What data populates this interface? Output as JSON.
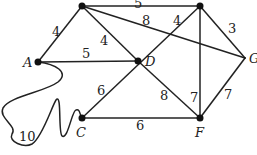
{
  "graph": {
    "nodes": {
      "A": {
        "label": "A"
      },
      "B": {
        "label": ""
      },
      "E": {
        "label": ""
      },
      "D": {
        "label": "D"
      },
      "G": {
        "label": "G"
      },
      "C": {
        "label": "C"
      },
      "F": {
        "label": "F"
      }
    },
    "edges": [
      {
        "from": "A",
        "to": "B",
        "weight": "4"
      },
      {
        "from": "B",
        "to": "E",
        "weight": "5"
      },
      {
        "from": "B",
        "to": "G",
        "weight": "8"
      },
      {
        "from": "B",
        "to": "D",
        "weight": "4"
      },
      {
        "from": "A",
        "to": "D",
        "weight": "5"
      },
      {
        "from": "E",
        "to": "C",
        "weight": "4"
      },
      {
        "from": "E",
        "to": "G",
        "weight": "3"
      },
      {
        "from": "E",
        "to": "F",
        "weight": "7"
      },
      {
        "from": "D",
        "to": "C",
        "weight": "6"
      },
      {
        "from": "D",
        "to": "F",
        "weight": "8"
      },
      {
        "from": "C",
        "to": "F",
        "weight": "6"
      },
      {
        "from": "G",
        "to": "F",
        "weight": "7"
      },
      {
        "from": "A",
        "to": "C",
        "weight": "10"
      }
    ]
  }
}
